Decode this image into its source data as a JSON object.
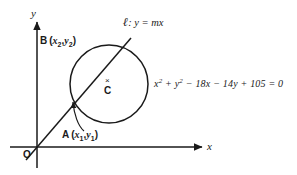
{
  "figure": {
    "type": "geometry-diagram",
    "background_color": "#ffffff",
    "stroke_color": "#1a1a1a",
    "axes": {
      "x_axis_label": "x",
      "y_axis_label": "y",
      "origin_label": "O"
    },
    "line": {
      "name_symbol": "ℓ",
      "equation_text": ": y = mx",
      "full_label": "ℓ : y = mx"
    },
    "circle": {
      "equation_parts": {
        "x_term": "x",
        "x_exp": "2",
        "plus1": " + ",
        "y_term": "y",
        "y_exp": "2",
        "rest": " − 18x − 14y + 105 = 0"
      },
      "equation_text": "x2 + y2 − 18x − 14y + 105 = 0",
      "center_mark": "×",
      "center_label": "C"
    },
    "points": {
      "lower_intersection": {
        "name": "A",
        "coord_x": "x",
        "coord_x_sub": "1",
        "coord_y": "y",
        "coord_y_sub": "1",
        "label_text": "A (x1 , y1)"
      },
      "upper_intersection": {
        "name": "B",
        "coord_x": "x",
        "coord_x_sub": "2",
        "coord_y": "y",
        "coord_y_sub": "2",
        "label_text": "B (x2 , y2)"
      }
    }
  }
}
